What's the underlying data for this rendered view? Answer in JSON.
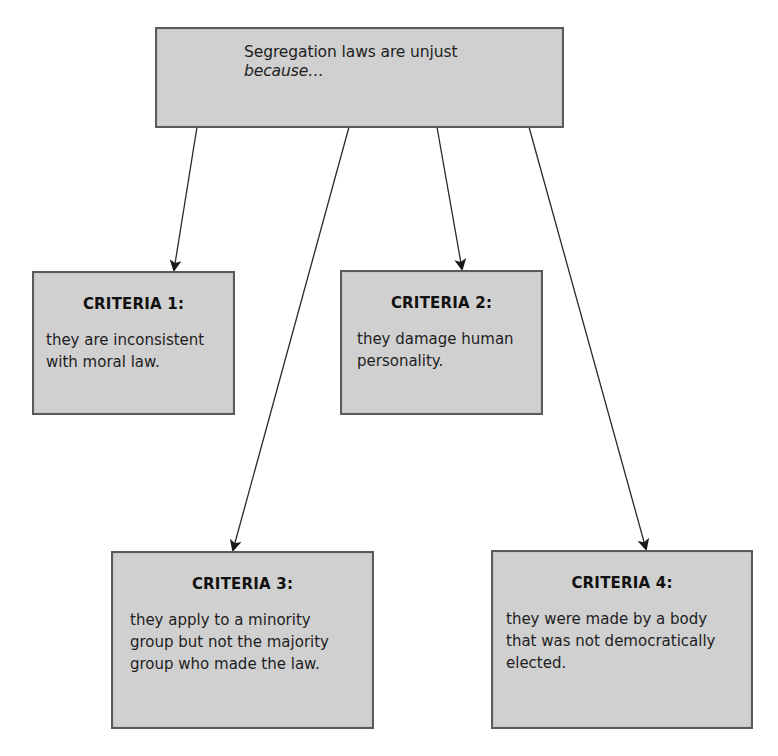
{
  "diagram": {
    "root": {
      "line1": "Segregation laws are unjust",
      "line2": "because…"
    },
    "criteria": [
      {
        "heading": "CRITERIA 1:",
        "lines": [
          "they are inconsistent",
          "with moral law."
        ]
      },
      {
        "heading": "CRITERIA 2:",
        "lines": [
          "they damage human",
          "personality."
        ]
      },
      {
        "heading": "CRITERIA 3:",
        "lines": [
          "they apply to a minority",
          "group but not the majority",
          "group who made the law."
        ]
      },
      {
        "heading": "CRITERIA 4:",
        "lines": [
          "they were made by a body",
          "that was not democratically",
          "elected."
        ]
      }
    ],
    "edges": [
      {
        "from": "root",
        "to": "criteria-1"
      },
      {
        "from": "root",
        "to": "criteria-2"
      },
      {
        "from": "root",
        "to": "criteria-3"
      },
      {
        "from": "root",
        "to": "criteria-4"
      }
    ],
    "colors": {
      "box_fill": "#d0d0d0",
      "box_border": "#5a5a5a",
      "arrow": "#222222",
      "background": "#ffffff"
    }
  }
}
